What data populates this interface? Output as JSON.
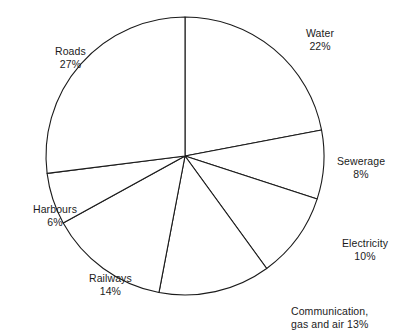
{
  "chart_data": {
    "type": "pie",
    "title": "",
    "subtitle": "",
    "xlabel": "",
    "ylabel": "",
    "legend_position": "none",
    "grid": false,
    "start_angle_deg": 0,
    "direction": "clockwise",
    "unit": "%",
    "categories": [
      "Water",
      "Sewerage",
      "Electricity",
      "Communication, gas and air",
      "Railways",
      "Harbours",
      "Roads"
    ],
    "values": [
      22,
      8,
      10,
      13,
      14,
      6,
      27
    ],
    "slices": [
      {
        "name": "Water",
        "value": 22,
        "value_text": "22%",
        "label_name": "Water",
        "label_value": "22%",
        "label_x": 306,
        "label_y": 27,
        "align": "center",
        "layout": "stacked"
      },
      {
        "name": "Sewerage",
        "value": 8,
        "value_text": "8%",
        "label_name": "Sewerage",
        "label_value": "8%",
        "label_x": 337,
        "label_y": 155,
        "align": "center",
        "layout": "stacked"
      },
      {
        "name": "Electricity",
        "value": 10,
        "value_text": "10%",
        "label_name": "Electricity",
        "label_value": "10%",
        "label_x": 342,
        "label_y": 237,
        "align": "center",
        "layout": "stacked"
      },
      {
        "name": "Communication, gas and air",
        "value": 13,
        "value_text": "13%",
        "label_name": "Communication,",
        "label_value": "gas and air 13%",
        "label_x": 291,
        "label_y": 305,
        "align": "left",
        "layout": "inline"
      },
      {
        "name": "Railways",
        "value": 14,
        "value_text": "14%",
        "label_name": "Railways",
        "label_value": "14%",
        "label_x": 89,
        "label_y": 272,
        "align": "center",
        "layout": "stacked"
      },
      {
        "name": "Harbours",
        "value": 6,
        "value_text": "6%",
        "label_name": "Harbours",
        "label_value": "6%",
        "label_x": 33,
        "label_y": 203,
        "align": "center",
        "layout": "stacked"
      },
      {
        "name": "Roads",
        "value": 27,
        "value_text": "27%",
        "label_name": "Roads",
        "label_value": "27%",
        "label_x": 55,
        "label_y": 45,
        "align": "center",
        "layout": "stacked"
      }
    ],
    "geometry": {
      "center_x": 185,
      "center_y": 156,
      "radius": 139
    },
    "colors": {
      "slice_fill": "#ffffff",
      "slice_stroke": "#1b1b1b",
      "text": "#1b1b1b",
      "background": "#ffffff"
    }
  }
}
